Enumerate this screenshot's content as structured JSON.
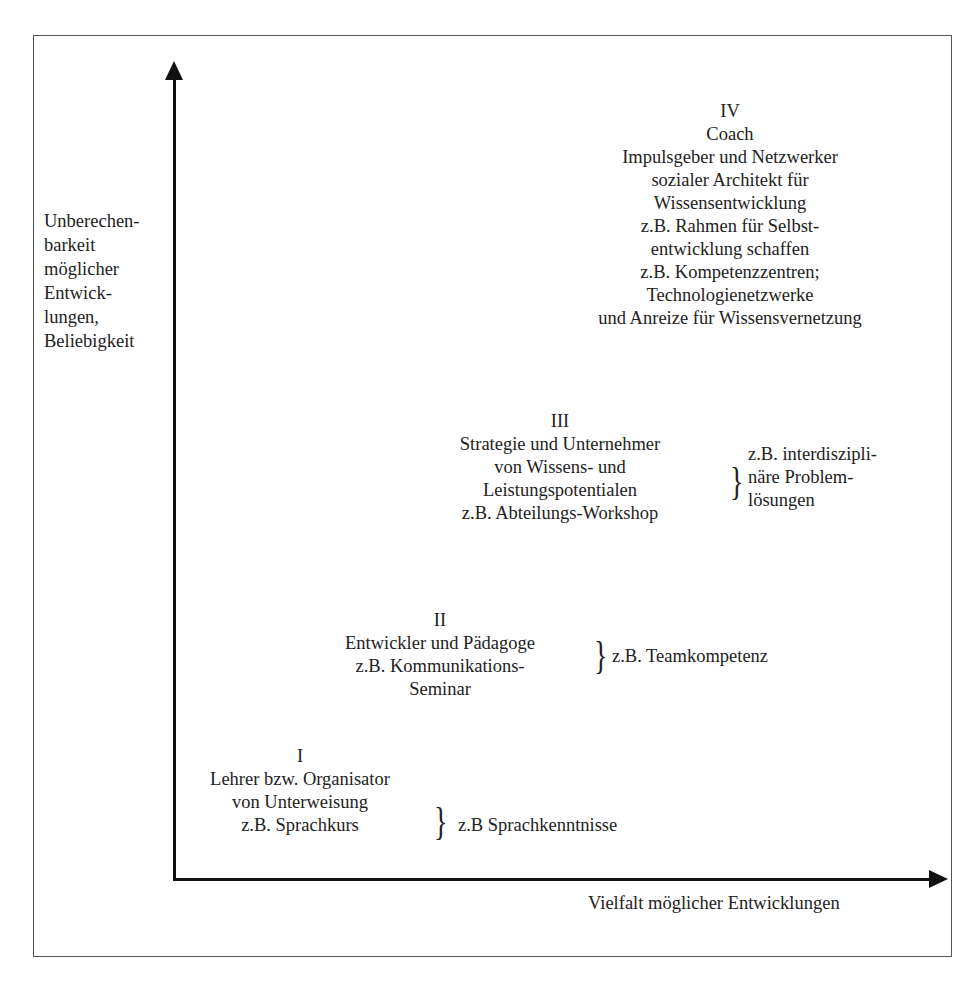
{
  "axes": {
    "y_label_lines": [
      "Unberechen-",
      "barkeit",
      "möglicher",
      "Entwick-",
      "lungen,",
      "Beliebigkeit"
    ],
    "x_label": "Vielfalt möglicher Entwicklungen"
  },
  "stages": [
    {
      "numeral": "I",
      "lines": [
        "Lehrer bzw. Organisator",
        "von Unterweisung",
        "z.B. Sprachkurs"
      ],
      "example_lines": [
        "z.B Sprachkenntnisse"
      ]
    },
    {
      "numeral": "II",
      "lines": [
        "Entwickler und Pädagoge",
        "z.B. Kommunikations-",
        "Seminar"
      ],
      "example_lines": [
        "z.B. Teamkompetenz"
      ]
    },
    {
      "numeral": "III",
      "lines": [
        "Strategie und Unternehmer",
        "von Wissens- und",
        "Leistungspotentialen",
        "z.B. Abteilungs-Workshop"
      ],
      "example_lines": [
        "z.B. interdiszipli-",
        "näre Problem-",
        "lösungen"
      ]
    },
    {
      "numeral": "IV",
      "lines": [
        "Coach",
        "Impulsgeber und Netzwerker",
        "sozialer Architekt für",
        "Wissensentwicklung",
        "z.B. Rahmen für Selbst-",
        "entwicklung schaffen",
        "z.B. Kompetenzzentren;",
        "Technologienetzwerke",
        "und Anreize für Wissensvernetzung"
      ],
      "example_lines": []
    }
  ],
  "brace_glyph": "}"
}
